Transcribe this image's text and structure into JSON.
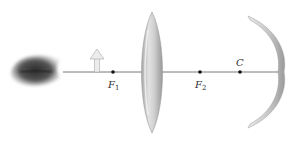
{
  "diagram": {
    "type": "optics-ray-diagram",
    "elements": [
      "eye",
      "object-arrow",
      "converging-lens",
      "concave-mirror"
    ],
    "points": [
      {
        "id": "F1",
        "label": "F",
        "subscript": "1",
        "x": 113
      },
      {
        "id": "F2",
        "label": "F",
        "subscript": "2",
        "x": 200
      },
      {
        "id": "C",
        "label": "C",
        "subscript": "",
        "x": 240
      }
    ],
    "colors": {
      "axis": "#555555",
      "lens": "#c8c8c8",
      "mirror": "#cfcfcf",
      "arrow": "#e0e0e0",
      "eye": "#3a3a3a"
    }
  }
}
